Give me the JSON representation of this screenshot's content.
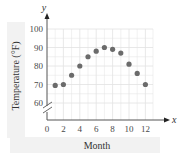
{
  "chart_data": {
    "type": "scatter",
    "title": "",
    "xlabel": "Month",
    "ylabel": "Temperature (°F)",
    "x_axis_var": "x",
    "y_axis_var": "y",
    "xlim": [
      0,
      13
    ],
    "ylim": [
      60,
      100
    ],
    "y_axis_break": true,
    "grid": true,
    "legend": null,
    "x_ticks": [
      0,
      2,
      4,
      6,
      8,
      10,
      12
    ],
    "y_ticks": [
      60,
      70,
      80,
      90,
      100
    ],
    "x": [
      1,
      2,
      3,
      4,
      5,
      6,
      7,
      8,
      9,
      10,
      11,
      12
    ],
    "y": [
      69.5,
      70,
      75,
      80,
      85,
      88,
      90,
      89,
      87,
      81,
      76,
      70
    ],
    "point_color": "#6b6b6b"
  },
  "labels": {
    "xlabel": "Month",
    "ylabel": "Temperature (°F)",
    "x_var": "x",
    "y_var": "y"
  },
  "colors": {
    "axis": "#555555",
    "grid": "#e2e2e2",
    "label_band": "#f1f1f1",
    "point": "#6b6b6b"
  }
}
